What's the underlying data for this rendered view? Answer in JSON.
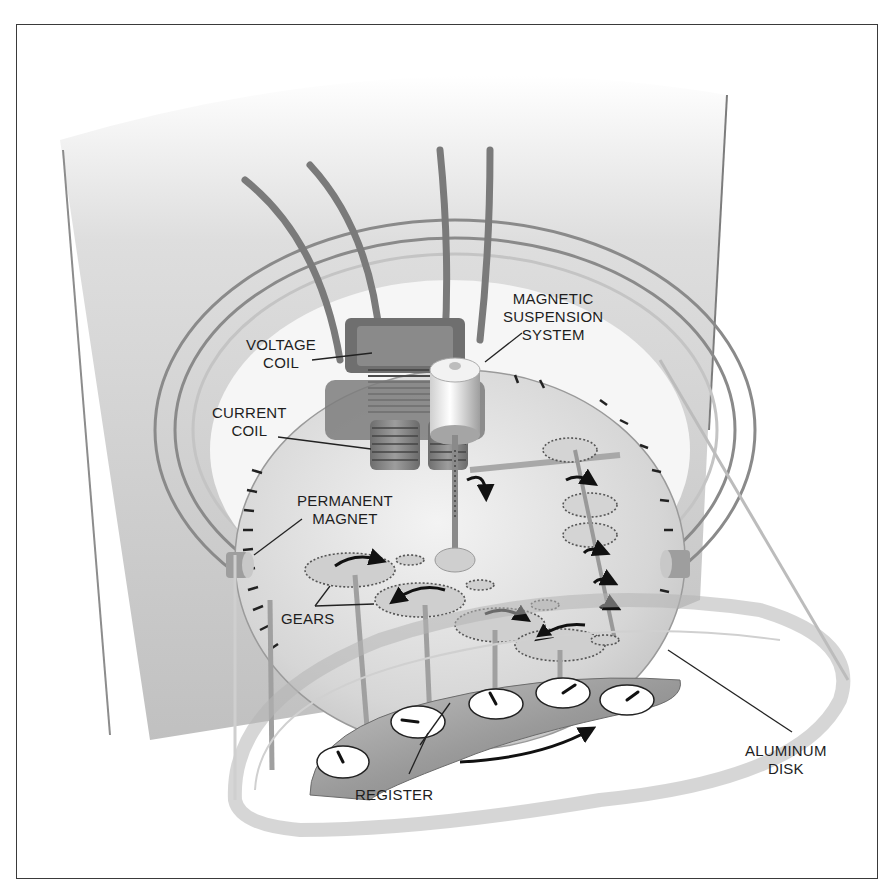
{
  "diagram": {
    "colors": {
      "border": "#3a3a3a",
      "wall": "#c8c8c8",
      "disk": "#d9d9d9",
      "register": "#9a9a9a",
      "dial_face": "#ffffff",
      "label_text": "#1e1e1e",
      "leader_line": "#222222"
    },
    "labels": [
      {
        "id": "voltage-coil",
        "lines": [
          "VOLTAGE",
          "COIL"
        ]
      },
      {
        "id": "current-coil",
        "lines": [
          "CURRENT",
          "COIL"
        ]
      },
      {
        "id": "magnetic-suspension-system",
        "lines": [
          "MAGNETIC",
          "SUSPENSION",
          "SYSTEM"
        ]
      },
      {
        "id": "permanent-magnet",
        "lines": [
          "PERMANENT",
          "MAGNET"
        ]
      },
      {
        "id": "gears",
        "lines": [
          "GEARS"
        ]
      },
      {
        "id": "register",
        "lines": [
          "REGISTER"
        ]
      },
      {
        "id": "aluminum-disk",
        "lines": [
          "ALUMINUM",
          "DISK"
        ]
      }
    ],
    "register_dials": 5,
    "rotation_arrows": [
      "disk-clockwise",
      "gear-1",
      "gear-2",
      "gear-3",
      "gear-4",
      "spindle-worm",
      "train-1",
      "train-2",
      "train-3"
    ]
  }
}
